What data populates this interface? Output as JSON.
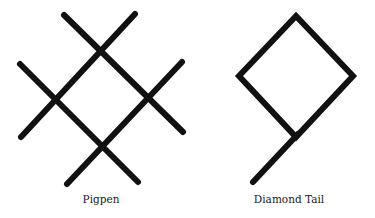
{
  "figures": [
    {
      "id": "pigpen",
      "label": "Pigpen",
      "label_pos": {
        "x": 101,
        "y": 193
      },
      "stroke_color": "#111111",
      "stroke_width": 6,
      "lines": [
        {
          "x1": 64,
          "y1": 15,
          "x2": 183,
          "y2": 132
        },
        {
          "x1": 135,
          "y1": 14,
          "x2": 21,
          "y2": 137
        },
        {
          "x1": 20,
          "y1": 64,
          "x2": 138,
          "y2": 182
        },
        {
          "x1": 182,
          "y1": 62,
          "x2": 67,
          "y2": 184
        }
      ]
    },
    {
      "id": "diamond-tail",
      "label": "Diamond Tail",
      "label_pos": {
        "x": 289,
        "y": 193
      },
      "stroke_color": "#111111",
      "stroke_width": 6,
      "polygon": [
        [
          296,
          16
        ],
        [
          353,
          76
        ],
        [
          296,
          137
        ],
        [
          239,
          76
        ]
      ],
      "tail": {
        "x1": 298,
        "y1": 134,
        "x2": 253,
        "y2": 182
      }
    }
  ]
}
